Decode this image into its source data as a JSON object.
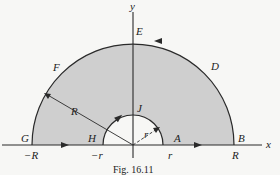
{
  "figure": {
    "caption": "Fig. 16.11",
    "colors": {
      "region_fill": "#cfcfcf",
      "stroke": "#2a2a2a",
      "background": "#f7f7f5"
    },
    "axes": {
      "x_label": "x",
      "y_label": "y"
    },
    "points": {
      "A": "A",
      "B": "B",
      "D": "D",
      "E": "E",
      "F": "F",
      "G": "G",
      "H": "H",
      "J": "J"
    },
    "tick_labels": {
      "neg_R": "−R",
      "neg_r": "−r",
      "pos_r": "r",
      "pos_R": "R"
    },
    "radius_labels": {
      "outer": "R",
      "inner": "r"
    }
  }
}
